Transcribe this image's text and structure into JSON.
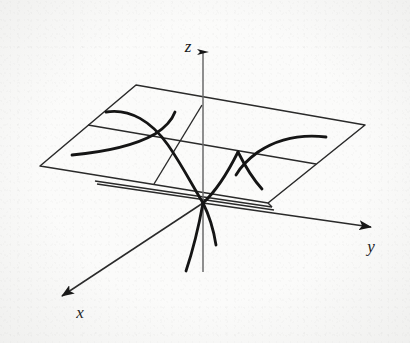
{
  "figure": {
    "kind": "math-diagram",
    "background_color": "#fbfbfa",
    "ink_color": "#1a1a1a",
    "axis_color": "#555555"
  },
  "axes": {
    "z": {
      "label": "z",
      "label_x": 188,
      "label_y": 52,
      "line": {
        "x1": 203,
        "y1": 272,
        "x2": 203,
        "y2": 44
      },
      "arrow": "up"
    },
    "y": {
      "label": "y",
      "label_x": 371,
      "label_y": 252,
      "line": {
        "x1": 203,
        "y1": 203,
        "x2": 376,
        "y2": 228
      },
      "arrow": "right-down"
    },
    "x": {
      "label": "x",
      "label_x": 80,
      "label_y": 318,
      "line": {
        "x1": 203,
        "y1": 203,
        "x2": 57,
        "y2": 299
      },
      "arrow": "left-down"
    }
  },
  "plane": {
    "name": "horizontal-plane",
    "vertices": [
      {
        "x": 136,
        "y": 85
      },
      {
        "x": 365,
        "y": 125
      },
      {
        "x": 268,
        "y": 203
      },
      {
        "x": 40,
        "y": 166
      }
    ],
    "gridlines": [
      {
        "x1": 88,
        "y1": 125,
        "x2": 316,
        "y2": 164,
        "note": "mid line parallel to top/bottom edges"
      },
      {
        "x1": 202,
        "y1": 105,
        "x2": 154,
        "y2": 184,
        "note": "mid line parallel to left/right edges"
      }
    ]
  },
  "curves": [
    {
      "name": "left-hyperbola-branch-upper",
      "note": "level curve descending from upper-left toward origin",
      "path": "M 106,112 C 130,108 152,122 168,145 C 182,165 192,185 203,203"
    },
    {
      "name": "left-hyperbola-branch-lower",
      "note": "level curve sweeping left from saddle node",
      "path": "M 72,155 C 104,152 134,146 155,134 C 166,127 172,120 175,112"
    },
    {
      "name": "right-hyperbola-branch-upper",
      "note": "level curve rising toward the right edge of the plane",
      "path": "M 326,137 C 300,134 276,140 258,152 C 247,160 240,168 236,175"
    },
    {
      "name": "right-hyperbola-branch-lower",
      "note": "level curve descending from saddle node to the right-front",
      "path": "M 238,152 C 244,164 252,178 262,189"
    },
    {
      "name": "parabola-through-origin-right",
      "note": "upward parabola from origin to the right saddle node",
      "path": "M 203,203 C 214,193 226,176 238,152"
    },
    {
      "name": "descending-curve-left",
      "note": "curve falling below the plane on the left",
      "path": "M 203,203 C 199,225 193,250 186,271"
    },
    {
      "name": "descending-curve-right",
      "note": "curve falling below the plane on the right",
      "path": "M 203,203 C 210,217 214,232 216,245"
    }
  ],
  "inner_outline": {
    "name": "front-edge-double-line",
    "segments": [
      {
        "x1": 95,
        "y1": 181,
        "x2": 272,
        "y2": 207
      },
      {
        "x1": 97,
        "y1": 184,
        "x2": 274,
        "y2": 210
      }
    ]
  },
  "labels": {
    "x_axis": "x",
    "y_axis": "y",
    "z_axis": "z"
  }
}
